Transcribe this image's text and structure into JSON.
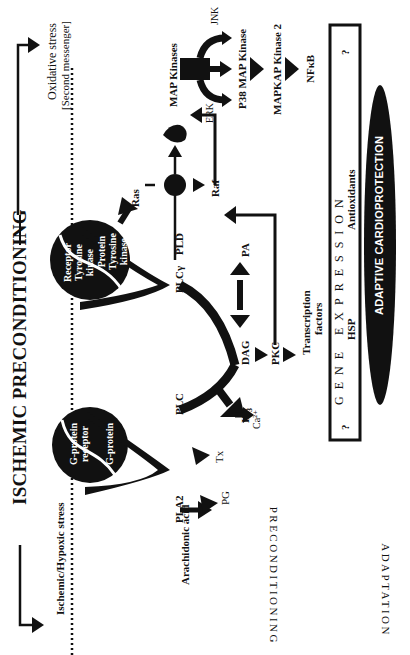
{
  "diagram": {
    "title": "ISCHEMIC PRECONDITIONING",
    "orientation": "rotated 90 degrees counter-clockwise",
    "stimuli": {
      "left": "Ischemic/Hypoxic stress",
      "right_line1": "Oxidative stress",
      "right_line2": "[Second messenger]"
    },
    "receptors": {
      "gprotein_receptor_line1": "G-protein",
      "gprotein_receptor_line2": "receptor",
      "gprotein": "G-protein",
      "rtk_line1": "Receptor",
      "rtk_line2": "Tyrosine",
      "rtk_line3": "kinase",
      "ptk_line1": "Protein",
      "ptk_line2": "Tyrosine",
      "ptk_line3": "kinase"
    },
    "nodes": {
      "pla2": "PLA2",
      "plc": "PLC",
      "plcg": "PLCγ",
      "pld": "PLD",
      "ras": "Ras",
      "raf": "Raf",
      "erk": "ERK",
      "map_kinases": "MAP Kinases",
      "jnk": "JNK",
      "p38": "P38 MAP Kinase",
      "mapkap2": "MAPKAP Kinase 2",
      "nfkb": "NFκB",
      "arachidonic": "Arachidonic acid",
      "tx": "Tx",
      "pg": "PG",
      "ca": "Ca²⁺",
      "ip3": "IP",
      "ip3_sub": "3",
      "dag": "DAG",
      "pa": "PA",
      "pkc": "PKC",
      "tf_line1": "Transcription",
      "tf_line2": "factors"
    },
    "gene_expression": {
      "label": "GENE EXPRESSION",
      "q_left": "?",
      "q_right": "?",
      "hsp": "HSP",
      "antioxidants": "Antioxidants"
    },
    "outcome": "ADAPTIVE CARDIOPROTECTION",
    "side_labels": {
      "preconditioning": "PRECONDITIONING",
      "adaptation": "ADAPTATION"
    },
    "colors": {
      "ink": "#111111",
      "background": "#ffffff"
    }
  }
}
